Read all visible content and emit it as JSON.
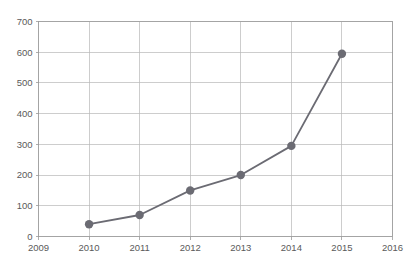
{
  "chart_data": {
    "type": "line",
    "title": "",
    "subtitle": "",
    "xlabel": "",
    "ylabel": "",
    "x": [
      2010,
      2011,
      2012,
      2013,
      2014,
      2015
    ],
    "values": [
      40,
      70,
      150,
      200,
      295,
      595
    ],
    "series": [
      {
        "name": "",
        "x": [
          2010,
          2011,
          2012,
          2013,
          2014,
          2015
        ],
        "values": [
          40,
          70,
          150,
          200,
          295,
          595
        ]
      }
    ],
    "xlim": [
      2009,
      2016
    ],
    "ylim": [
      0,
      700
    ],
    "x_tick_labels": [
      "2009",
      "2010",
      "2011",
      "2012",
      "2013",
      "2014",
      "2015",
      "2016"
    ],
    "x_ticks": [
      2009,
      2010,
      2011,
      2012,
      2013,
      2014,
      2015,
      2016
    ],
    "y_tick_labels": [
      "0",
      "100",
      "200",
      "300",
      "400",
      "500",
      "600",
      "700"
    ],
    "y_ticks": [
      0,
      100,
      200,
      300,
      400,
      500,
      600,
      700
    ],
    "grid": {
      "horizontal": true,
      "vertical": true,
      "color": "#b8b8b8"
    },
    "legend": {
      "visible": false,
      "position": "none",
      "entries": []
    },
    "annotations": [],
    "marker": {
      "shape": "circle",
      "radius": 4.2,
      "color": "#6b6b73"
    },
    "line": {
      "color": "#6b6b73",
      "width": 1.8
    },
    "background_color": "#ffffff",
    "axis_color": "#9a9a9a",
    "tick_label_color": "#5a5a5a"
  }
}
